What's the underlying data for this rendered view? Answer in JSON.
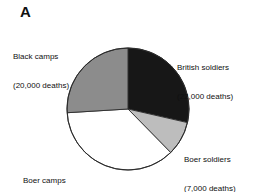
{
  "panel": {
    "letter": "A"
  },
  "colors": {
    "british_soldiers": "#171717",
    "boer_soldiers": "#bdbdbd",
    "boer_camps": "#ffffff",
    "black_camps": "#8c8c8c",
    "outline": "#2b2b2b",
    "text": "#101010"
  },
  "labels": {
    "black_camps": {
      "name": "Black camps",
      "value": "(20,000 deaths)"
    },
    "british_soldiers": {
      "name": "British soldiers",
      "value": "(22,000 deaths)"
    },
    "boer_soldiers": {
      "name": "Boer soldiers",
      "value": "(7,000 deaths)"
    },
    "boer_camps": {
      "name": "Boer camps",
      "value": "(28,000 deaths)"
    }
  },
  "chart_data": {
    "type": "pie",
    "title": "A",
    "xlabel": "",
    "ylabel": "",
    "total": 77000,
    "units": "deaths",
    "start_angle_deg": 0,
    "direction": "clockwise",
    "legend_position": "callout-labels",
    "grid": false,
    "categories": [
      "British soldiers",
      "Boer soldiers",
      "Boer camps",
      "Black camps"
    ],
    "values": [
      22000,
      7000,
      28000,
      20000
    ],
    "slices": [
      {
        "label": "British soldiers",
        "value": 22000,
        "value_text": "22,000 deaths",
        "percent": 28.6,
        "start_deg": 0,
        "end_deg": 102.9,
        "color": "#171717"
      },
      {
        "label": "Boer soldiers",
        "value": 7000,
        "value_text": "7,000 deaths",
        "percent": 9.1,
        "start_deg": 102.9,
        "end_deg": 135.6,
        "color": "#bdbdbd"
      },
      {
        "label": "Boer camps",
        "value": 28000,
        "value_text": "28,000 deaths",
        "percent": 36.4,
        "start_deg": 135.6,
        "end_deg": 266.5,
        "color": "#ffffff"
      },
      {
        "label": "Black camps",
        "value": 20000,
        "value_text": "20,000 deaths",
        "percent": 26.0,
        "start_deg": 266.5,
        "end_deg": 360,
        "color": "#8c8c8c"
      }
    ]
  }
}
